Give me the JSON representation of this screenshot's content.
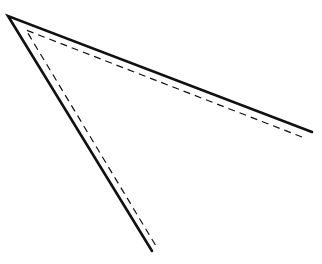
{
  "diagram": {
    "background": "#ffffff",
    "stroke_color": "#111111",
    "solid_angle": {
      "apex": [
        8,
        16
      ],
      "upper_end": [
        312,
        132
      ],
      "lower_end": [
        152,
        251
      ],
      "stroke_width": 2.6
    },
    "dashed_angle": {
      "apex": [
        26,
        30
      ],
      "upper_end": [
        302,
        137
      ],
      "lower_end": [
        156,
        246
      ],
      "stroke_width": 1.2,
      "dash": "7,5"
    }
  }
}
